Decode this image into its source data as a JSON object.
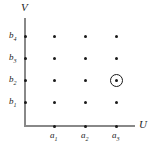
{
  "figure": {
    "axes": {
      "x_name": "U",
      "y_name": "V"
    },
    "x_ticks": [
      {
        "label": "a",
        "sub": "1",
        "x": 54
      },
      {
        "label": "a",
        "sub": "2",
        "x": 85
      },
      {
        "label": "a",
        "sub": "3",
        "x": 116
      }
    ],
    "y_ticks": [
      {
        "label": "b",
        "sub": "4",
        "y": 36
      },
      {
        "label": "b",
        "sub": "3",
        "y": 58
      },
      {
        "label": "b",
        "sub": "2",
        "y": 80
      },
      {
        "label": "b",
        "sub": "1",
        "y": 102
      }
    ],
    "lattice_points": [
      {
        "x": 25,
        "y": 36
      },
      {
        "x": 54,
        "y": 36
      },
      {
        "x": 85,
        "y": 36
      },
      {
        "x": 116,
        "y": 36
      },
      {
        "x": 25,
        "y": 58
      },
      {
        "x": 54,
        "y": 58
      },
      {
        "x": 85,
        "y": 58
      },
      {
        "x": 116,
        "y": 58
      },
      {
        "x": 25,
        "y": 80
      },
      {
        "x": 54,
        "y": 80
      },
      {
        "x": 85,
        "y": 80
      },
      {
        "x": 116,
        "y": 80
      },
      {
        "x": 25,
        "y": 102
      },
      {
        "x": 54,
        "y": 102
      },
      {
        "x": 85,
        "y": 102
      },
      {
        "x": 116,
        "y": 102
      },
      {
        "x": 54,
        "y": 126
      },
      {
        "x": 85,
        "y": 126
      },
      {
        "x": 116,
        "y": 126
      }
    ],
    "highlighted_point": {
      "x": 116,
      "y": 80
    },
    "colors": {
      "dot": "#1a1a1a",
      "axis": "#888888",
      "text": "#222222",
      "background": "#ffffff"
    }
  }
}
